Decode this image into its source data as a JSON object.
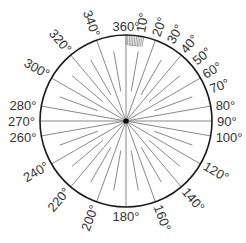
{
  "diagram": {
    "center": {
      "x": 126,
      "y": 121
    },
    "radius": 86,
    "colors": {
      "circle": "#1a1a1a",
      "spoke": "#7a7a7a",
      "label": "#333333",
      "hatch": "#8a8a8a",
      "center_dot": "#000000"
    },
    "labels": [
      {
        "angle": 0,
        "text": "360°"
      },
      {
        "angle": 10,
        "text": "10°"
      },
      {
        "angle": 20,
        "text": "20°"
      },
      {
        "angle": 30,
        "text": "30°"
      },
      {
        "angle": 40,
        "text": "40°"
      },
      {
        "angle": 50,
        "text": "50°"
      },
      {
        "angle": 60,
        "text": "60°"
      },
      {
        "angle": 70,
        "text": "70°"
      },
      {
        "angle": 80,
        "text": "80°"
      },
      {
        "angle": 90,
        "text": "90°"
      },
      {
        "angle": 100,
        "text": "100°"
      },
      {
        "angle": 120,
        "text": "120°"
      },
      {
        "angle": 140,
        "text": "140°"
      },
      {
        "angle": 160,
        "text": "160°"
      },
      {
        "angle": 180,
        "text": "180°"
      },
      {
        "angle": 200,
        "text": "200°"
      },
      {
        "angle": 220,
        "text": "220°"
      },
      {
        "angle": 240,
        "text": "240°"
      },
      {
        "angle": 260,
        "text": "260°"
      },
      {
        "angle": 270,
        "text": "270°"
      },
      {
        "angle": 280,
        "text": "280°"
      },
      {
        "angle": 300,
        "text": "300°"
      },
      {
        "angle": 320,
        "text": "320°"
      },
      {
        "angle": 340,
        "text": "340°"
      }
    ],
    "spokes": {
      "full_angles": [
        0,
        20,
        40,
        60,
        80,
        90,
        100,
        120,
        140,
        160,
        180,
        200,
        220,
        240,
        260,
        270,
        280,
        300,
        320,
        340
      ],
      "short_angles": [
        10,
        30,
        50,
        70,
        110,
        130,
        150,
        170,
        190,
        210,
        230,
        250,
        290,
        310,
        330,
        350
      ],
      "short_inner_ratio": 0.35
    },
    "hatch": {
      "start_angle": 0,
      "end_angle": 12,
      "depth": 10
    }
  }
}
